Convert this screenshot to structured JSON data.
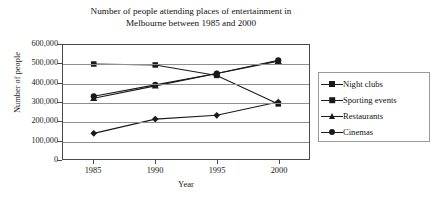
{
  "chart_data": {
    "type": "line",
    "title": "Number of people attending places of entertainment in\nMelbourne between 1985 and 2000",
    "xlabel": "Year",
    "ylabel": "Number of people",
    "categories": [
      "1985",
      "1990",
      "1995",
      "2000"
    ],
    "x": [
      1985,
      1990,
      1995,
      2000
    ],
    "xlim": [
      1983,
      2002
    ],
    "ylim": [
      0,
      600000
    ],
    "ytick_labels": [
      "600,000",
      "500,000",
      "400,000",
      "300,000",
      "200,000",
      "100,000",
      "0"
    ],
    "ytick_values": [
      600000,
      500000,
      400000,
      300000,
      200000,
      100000,
      0
    ],
    "grid": true,
    "grid_axis": "y",
    "legend_position": "right",
    "line_color": "#1a1a1a",
    "series": [
      {
        "name": "Night clubs",
        "marker": "diamond",
        "values": [
          135000,
          210000,
          230000,
          300000
        ]
      },
      {
        "name": "Sporting events",
        "marker": "square",
        "values": [
          500000,
          495000,
          440000,
          290000
        ]
      },
      {
        "name": "Restaurants",
        "marker": "triangle",
        "values": [
          320000,
          385000,
          450000,
          515000
        ]
      },
      {
        "name": "Cinemas",
        "marker": "circle",
        "values": [
          330000,
          390000,
          450000,
          520000
        ]
      }
    ]
  }
}
